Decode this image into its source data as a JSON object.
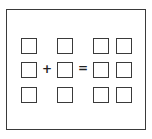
{
  "diagram": {
    "colors": {
      "stroke": "#3a3a3a",
      "background": "#ffffff"
    },
    "operators": {
      "plus": "+",
      "equals": "="
    },
    "boxes": [
      {
        "row": 1,
        "col": 1,
        "x": 21,
        "y": 38
      },
      {
        "row": 1,
        "col": 2,
        "x": 57,
        "y": 38
      },
      {
        "row": 1,
        "col": 3,
        "x": 93,
        "y": 38
      },
      {
        "row": 1,
        "col": 4,
        "x": 116,
        "y": 38
      },
      {
        "row": 2,
        "col": 1,
        "x": 21,
        "y": 62
      },
      {
        "row": 2,
        "col": 2,
        "x": 57,
        "y": 62
      },
      {
        "row": 2,
        "col": 3,
        "x": 93,
        "y": 62
      },
      {
        "row": 2,
        "col": 4,
        "x": 116,
        "y": 62
      },
      {
        "row": 3,
        "col": 1,
        "x": 21,
        "y": 87
      },
      {
        "row": 3,
        "col": 2,
        "x": 57,
        "y": 87
      },
      {
        "row": 3,
        "col": 3,
        "x": 93,
        "y": 87
      },
      {
        "row": 3,
        "col": 4,
        "x": 116,
        "y": 87
      }
    ]
  }
}
